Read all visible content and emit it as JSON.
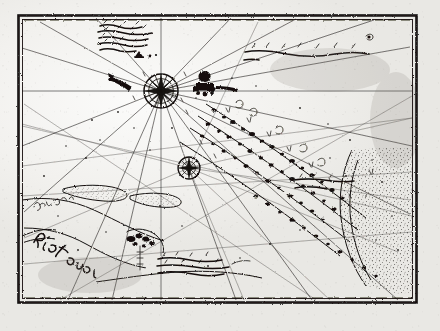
{
  "document": {
    "kind": "antique-nautical-chart-scan",
    "title": "Portolan sea chart (manuscript)",
    "media": "ink on paper, monochrome photographic reproduction",
    "canvas": {
      "width": 440,
      "height": 331
    },
    "background_color": "#efeeec",
    "ink_color": "#14110e"
  },
  "frame": {
    "name": "ruled border",
    "outer": {
      "x": 18,
      "y": 15,
      "width": 399,
      "height": 288
    },
    "inner": {
      "x": 22,
      "y": 19,
      "width": 391,
      "height": 280
    },
    "style": "double ruled line, hand drawn, irregular"
  },
  "compass": {
    "primary": {
      "label": "compass rose",
      "cx": 161,
      "cy": 91,
      "radius": 17,
      "points": 16,
      "rhumb_count": 16
    },
    "secondary": {
      "label": "secondary rhumb node",
      "cx": 189,
      "cy": 168,
      "radius": 11,
      "points": 8
    }
  },
  "cartouches": [
    {
      "name": "upper-left inscription",
      "x": 96,
      "y": 23,
      "width": 66,
      "height": 32,
      "lines": 5,
      "legible": false,
      "transcription": "[illegible manuscript note]"
    },
    {
      "name": "upper-right caption",
      "x": 243,
      "y": 45,
      "width": 125,
      "height": 18,
      "lines": 2,
      "legible": false,
      "transcription": "[illegible manuscript caption]"
    },
    {
      "name": "lower-centre inscription",
      "x": 156,
      "y": 256,
      "width": 84,
      "height": 26,
      "lines": 3,
      "legible": false,
      "transcription": "[illegible manuscript note]"
    },
    {
      "name": "mid-right inscription",
      "x": 293,
      "y": 176,
      "width": 62,
      "height": 18,
      "lines": 2,
      "legible": false,
      "transcription": "[illegible manuscript note]"
    }
  ],
  "place_labels": [
    {
      "name": "punta-label",
      "text": "Punta",
      "x": 39,
      "y": 205,
      "rotation": -8,
      "size": 5.4
    },
    {
      "name": "rio-label",
      "text": "Rio de",
      "x": 38,
      "y": 243,
      "rotation": 34,
      "size": 7.2
    }
  ],
  "features": [
    {
      "name": "island-chain",
      "label": "diagonal chain of islets and shoals",
      "from": [
        205,
        100
      ],
      "to": [
        360,
        215
      ]
    },
    {
      "name": "elongated-shoal-west",
      "label": "elongated shoal",
      "from": [
        62,
        188
      ],
      "to": [
        138,
        205
      ]
    },
    {
      "name": "landmass-east",
      "label": "stippled landmass",
      "x": 352,
      "y": 170,
      "width": 62,
      "height": 120
    },
    {
      "name": "settlement-marker",
      "label": "settlement symbol",
      "x": 203,
      "y": 82
    },
    {
      "name": "coast-river-mouth",
      "label": "river mouth",
      "x": 130,
      "y": 238
    }
  ],
  "soundings": {
    "label": "scattered depth figures and stipple",
    "count": 64
  }
}
